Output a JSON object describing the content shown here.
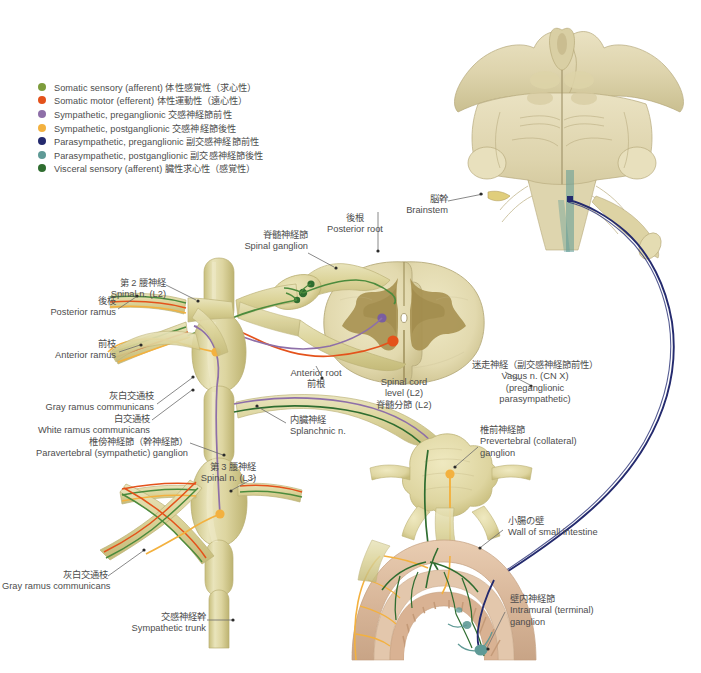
{
  "legend": {
    "items": [
      {
        "label": "Somatic sensory (afferent)  体性感覚性（求心性）",
        "color": "#7d9c3c",
        "name": "somatic-sensory-afferent"
      },
      {
        "label": "Somatic motor (efferent)  体性運動性（遠心性）",
        "color": "#e4521b",
        "name": "somatic-motor-efferent"
      },
      {
        "label": "Sympathetic, preganglionic  交感神経節前性",
        "color": "#8e6fa8",
        "name": "sympathetic-preganglionic"
      },
      {
        "label": "Sympathetic, postganglionic  交感神経節後性",
        "color": "#f3b13f",
        "name": "sympathetic-postganglionic"
      },
      {
        "label": "Parasympathetic, preganglionic  副交感神経節前性",
        "color": "#242a6e",
        "name": "parasympathetic-preganglionic"
      },
      {
        "label": "Parasympathetic, postganglionic  副交感神経節後性",
        "color": "#5f9a96",
        "name": "parasympathetic-postganglionic"
      },
      {
        "label": "Visceral sensory (afferent)  臓性求心性（感覚性）",
        "color": "#2f6d30",
        "name": "visceral-sensory-afferent"
      }
    ]
  },
  "labels": {
    "brainstem": {
      "jp": "脳幹",
      "en": "Brainstem"
    },
    "posterior_root": {
      "jp": "後根",
      "en": "Posterior root"
    },
    "spinal_ganglion": {
      "jp": "脊髄神経節",
      "en": "Spinal ganglion"
    },
    "spinal_n_l2": {
      "jp": "第 2 腰神経",
      "en": "Spinal n. (L2)"
    },
    "posterior_ramus": {
      "jp": "後枝",
      "en": "Posterior ramus"
    },
    "anterior_ramus": {
      "jp": "前枝",
      "en": "Anterior ramus"
    },
    "gray_ramus_1": {
      "jp": "灰白交通枝",
      "en": "Gray ramus communicans"
    },
    "white_ramus": {
      "jp": "白交通枝",
      "en": "White ramus communicans"
    },
    "paravertebral_ganglion": {
      "jp": "椎傍神経節（幹神経節）",
      "en": "Paravertebral (sympathetic) ganglion"
    },
    "spinal_n_l3": {
      "jp": "第 3 腰神経",
      "en": "Spinal n. (L3)"
    },
    "gray_ramus_2": {
      "jp": "灰白交通枝",
      "en": "Gray ramus communicans"
    },
    "sympathetic_trunk": {
      "jp": "交感神経幹",
      "en": "Sympathetic trunk"
    },
    "anterior_root": {
      "en": "Anterior root",
      "jp": "前根"
    },
    "spinal_cord_level": {
      "en1": "Spinal cord",
      "en2": "level (L2)",
      "jp": "脊髄分節 (L2)"
    },
    "splanchnic_n": {
      "jp": "内臓神経",
      "en": "Splanchnic n."
    },
    "vagus_n": {
      "jp": "迷走神経（副交感神経節前性）",
      "en1": "Vagus n. (CN X)",
      "en2": "(preganglionic",
      "en3": "parasympathetic)"
    },
    "prevertebral_ganglion": {
      "jp": "椎前神経節",
      "en1": "Prevertebral (collateral)",
      "en2": "ganglion"
    },
    "wall_small_intestine": {
      "jp": "小腸の壁",
      "en": "Wall of small intestine"
    },
    "intramural_ganglion": {
      "jp": "壁内神経節",
      "en1": "Intramural (terminal)",
      "en2": "ganglion"
    }
  },
  "colors": {
    "nerve_sheath": "#ddd9a0",
    "nerve_sheath_dark": "#c9c176",
    "bone_cream": "#e4dcb4",
    "gray_matter": "#a89253",
    "leader_line": "#6b6b6b",
    "intestine_wall": "#d8b79a"
  }
}
